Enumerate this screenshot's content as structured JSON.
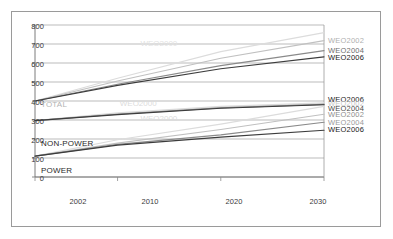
{
  "chart_data": {
    "type": "line",
    "title": "",
    "subtitle": "",
    "xlabel": "",
    "ylabel": "",
    "xlim": [
      2002,
      2030
    ],
    "ylim": [
      0,
      800
    ],
    "x": [
      2002,
      2010,
      2020,
      2030
    ],
    "yticks": [
      0,
      100,
      200,
      300,
      400,
      500,
      600,
      700,
      800
    ],
    "xticks": [
      2002,
      2010,
      2020,
      2030
    ],
    "grid": "horizontal",
    "legend_position": "right-inline",
    "groups": [
      {
        "name": "TOTAL",
        "label_color": "#b4b4b4",
        "series": [
          {
            "name": "WEO2000",
            "color": "#dcdcdc",
            "values": [
              400,
              520,
              660,
              760
            ]
          },
          {
            "name": "WEO2002",
            "color": "#c0c0c0",
            "values": [
              400,
              505,
              625,
              718
            ]
          },
          {
            "name": "WEO2004",
            "color": "#8a8a8a",
            "values": [
              400,
              488,
              586,
              665
            ]
          },
          {
            "name": "WEO2006",
            "color": "#3c3c3c",
            "values": [
              400,
              482,
              570,
              632
            ]
          }
        ]
      },
      {
        "name": "NON-POWER",
        "label_color": "#2a2a2a",
        "series": [
          {
            "name": "WEO2000",
            "color": "#dcdcdc",
            "values": [
              297,
              338,
              372,
              390
            ]
          },
          {
            "name": "WEO2002",
            "color": "#c0c0c0",
            "values": [
              297,
              332,
              366,
              384
            ]
          },
          {
            "name": "WEO2004",
            "color": "#8a8a8a",
            "values": [
              297,
              330,
              364,
              382
            ]
          },
          {
            "name": "WEO2006",
            "color": "#3c3c3c",
            "values": [
              297,
              328,
              362,
              380
            ]
          }
        ]
      },
      {
        "name": "POWER",
        "label_color": "#2a2a2a",
        "series": [
          {
            "name": "WEO2000",
            "color": "#dcdcdc",
            "values": [
              110,
              196,
              278,
              372
            ]
          },
          {
            "name": "WEO2002",
            "color": "#c0c0c0",
            "values": [
              110,
              178,
              250,
              330
            ]
          },
          {
            "name": "WEO2004",
            "color": "#8a8a8a",
            "values": [
              110,
              172,
              222,
              288
            ]
          },
          {
            "name": "WEO2006",
            "color": "#3c3c3c",
            "values": [
              110,
              168,
              210,
              246
            ]
          }
        ]
      }
    ],
    "right_labels": [
      {
        "text": "WEO2002",
        "color": "#b0b0b0",
        "y_value": 718
      },
      {
        "text": "WEO2004",
        "color": "#6e6e6e",
        "y_value": 665
      },
      {
        "text": "WEO2006",
        "color": "#1a1a1a",
        "y_value": 632
      },
      {
        "text": "WEO2006",
        "color": "#1a1a1a",
        "y_value": 408
      },
      {
        "text": "WEO2002",
        "color": "#c8c8c8",
        "y_value": 386
      },
      {
        "text": "WEO2004",
        "color": "#4a4a4a",
        "y_value": 360
      },
      {
        "text": "WEO2002",
        "color": "#8e8e8e",
        "y_value": 332
      },
      {
        "text": "WEO2004",
        "color": "#9a9a9a",
        "y_value": 288
      },
      {
        "text": "WEO2006",
        "color": "#1a1a1a",
        "y_value": 252
      }
    ],
    "watermarks": [
      {
        "text": "WEO2000",
        "color": "#e2e2e2",
        "x_value": 2014,
        "y_value": 688
      },
      {
        "text": "WEO2000",
        "color": "#dcdcdc",
        "x_value": 2012,
        "y_value": 372
      },
      {
        "text": "WEO2000",
        "color": "#dcdcdc",
        "x_value": 2014,
        "y_value": 296
      }
    ]
  },
  "axis": {
    "ytick_labels": [
      "800",
      "700",
      "600",
      "500",
      "400",
      "300",
      "200",
      "100",
      "0"
    ],
    "xtick_labels": [
      "2002",
      "2010",
      "2020",
      "2030"
    ]
  },
  "group_labels": {
    "total": "TOTAL",
    "non_power": "NON-POWER",
    "power": "POWER"
  }
}
